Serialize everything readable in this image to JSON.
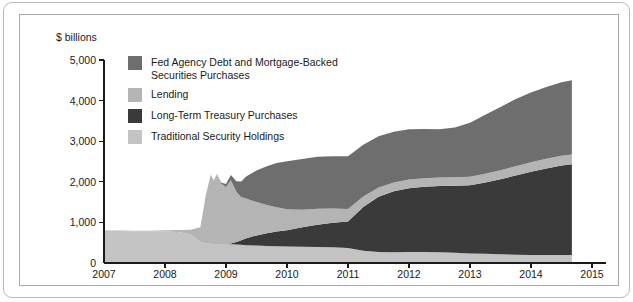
{
  "figure": {
    "axis_unit_label": "$ billions"
  },
  "chart_data": {
    "type": "area",
    "stacked": true,
    "title": "",
    "subtitle": "",
    "xlabel": "",
    "ylabel": "$ billions",
    "xlim": [
      2007,
      2015
    ],
    "ylim": [
      0,
      5000
    ],
    "grid": false,
    "legend_position": "inside-top-left",
    "xticks": [
      "2007",
      "2008",
      "2009",
      "2010",
      "2011",
      "2012",
      "2013",
      "2014",
      "2015"
    ],
    "yticks": [
      "0",
      "1,000",
      "2,000",
      "3,000",
      "4,000",
      "5,000"
    ],
    "colors": {
      "fed_agency": "#6e6e6e",
      "lending": "#b4b4b4",
      "long_term_treasury": "#3a3a3a",
      "traditional": "#c3c3c3",
      "frame": "#b9b9b9",
      "axis": "#1a1a1a"
    },
    "legend": [
      {
        "label": "Fed Agency Debt and Mortgage-Backed Securities Purchases",
        "color": "#6e6e6e"
      },
      {
        "label": "Lending",
        "color": "#b4b4b4"
      },
      {
        "label": "Long-Term Treasury Purchases",
        "color": "#3a3a3a"
      },
      {
        "label": "Traditional Security Holdings",
        "color": "#c3c3c3"
      }
    ],
    "x": [
      2007.0,
      2007.25,
      2007.5,
      2007.75,
      2008.0,
      2008.25,
      2008.42,
      2008.58,
      2008.67,
      2008.75,
      2008.8,
      2008.85,
      2008.92,
      2009.0,
      2009.08,
      2009.17,
      2009.25,
      2009.33,
      2009.5,
      2009.67,
      2009.83,
      2010.0,
      2010.25,
      2010.5,
      2010.75,
      2011.0,
      2011.25,
      2011.5,
      2011.75,
      2012.0,
      2012.25,
      2012.5,
      2012.75,
      2013.0,
      2013.25,
      2013.5,
      2013.75,
      2014.0,
      2014.25,
      2014.5,
      2014.67
    ],
    "series": [
      {
        "name": "Traditional Security Holdings",
        "values": [
          790,
          790,
          785,
          780,
          780,
          760,
          700,
          520,
          480,
          475,
          470,
          470,
          470,
          465,
          460,
          455,
          450,
          440,
          430,
          420,
          415,
          405,
          400,
          395,
          390,
          370,
          300,
          270,
          265,
          270,
          270,
          265,
          250,
          235,
          225,
          215,
          205,
          200,
          200,
          200,
          200
        ]
      },
      {
        "name": "Long-Term Treasury Purchases",
        "values": [
          0,
          0,
          0,
          0,
          0,
          0,
          0,
          0,
          0,
          0,
          0,
          0,
          0,
          0,
          20,
          60,
          110,
          170,
          250,
          310,
          360,
          400,
          480,
          550,
          600,
          650,
          1080,
          1360,
          1500,
          1570,
          1610,
          1630,
          1650,
          1680,
          1760,
          1850,
          1950,
          2050,
          2130,
          2200,
          2230
        ]
      },
      {
        "name": "Lending",
        "values": [
          10,
          10,
          12,
          15,
          25,
          55,
          120,
          360,
          1200,
          1700,
          1560,
          1720,
          1490,
          1410,
          1560,
          1240,
          1060,
          980,
          820,
          700,
          600,
          520,
          430,
          390,
          350,
          310,
          260,
          230,
          220,
          215,
          210,
          210,
          210,
          210,
          215,
          220,
          225,
          230,
          235,
          240,
          240
        ]
      },
      {
        "name": "Fed Agency Debt and Mortgage-Backed Securities Purchases",
        "values": [
          0,
          0,
          0,
          0,
          0,
          0,
          0,
          0,
          0,
          0,
          0,
          0,
          20,
          70,
          130,
          260,
          390,
          540,
          780,
          950,
          1090,
          1180,
          1250,
          1280,
          1290,
          1300,
          1270,
          1260,
          1250,
          1240,
          1210,
          1190,
          1230,
          1330,
          1450,
          1560,
          1660,
          1720,
          1770,
          1810,
          1830
        ]
      }
    ]
  }
}
